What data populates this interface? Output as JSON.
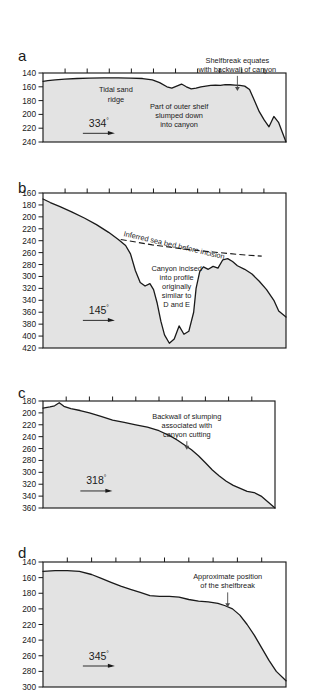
{
  "figure": {
    "type": "multi-panel-profile",
    "depth_unit": "m",
    "background_fill": "#e3e3e3",
    "line_color": "#1a1a1a"
  },
  "chart_data": [
    {
      "type": "area",
      "panel": "a",
      "label": "a",
      "ylabel": "",
      "xlabel": "",
      "ylim": [
        140,
        240
      ],
      "y_ticks": [
        140,
        160,
        180,
        200,
        220,
        240
      ],
      "y_direction": "inverted",
      "x_ticks": 11,
      "grid": false,
      "bearing": "334",
      "bearing_degree_symbol": "°",
      "annotations": [
        {
          "text_lines": [
            "Tidal sand",
            "ridge"
          ],
          "x_frac": 0.3,
          "y_depth": 168
        },
        {
          "text_lines": [
            "Part of outer shelf",
            "slumped down",
            "into canyon"
          ],
          "x_frac": 0.56,
          "y_depth": 192
        },
        {
          "text_lines": [
            "Shelfbreak equates",
            "with backwall of canyon"
          ],
          "x_frac": 0.8,
          "y_depth": 125,
          "arrow_to_depth": 166
        }
      ],
      "x": [
        0,
        2,
        5,
        9,
        14,
        19,
        25,
        31,
        36,
        41,
        45,
        48,
        51,
        53,
        55,
        57,
        59,
        61,
        63,
        65,
        67,
        69,
        71,
        73,
        75,
        77,
        79,
        81,
        83,
        85,
        87,
        89,
        91,
        93,
        95,
        97,
        100
      ],
      "y": [
        152,
        151,
        150,
        149,
        148,
        147.5,
        147,
        147,
        147.5,
        148,
        150,
        154,
        160,
        162,
        159,
        156,
        160,
        163,
        162,
        160,
        159,
        158,
        157.5,
        158,
        157,
        157,
        157.5,
        158,
        159,
        164,
        180,
        196,
        208,
        218,
        203,
        212,
        240
      ]
    },
    {
      "type": "area",
      "panel": "b",
      "label": "b",
      "ylabel": "",
      "xlabel": "",
      "ylim": [
        160,
        420
      ],
      "y_ticks": [
        160,
        180,
        200,
        220,
        240,
        260,
        280,
        300,
        320,
        340,
        360,
        380,
        400,
        420
      ],
      "y_direction": "inverted",
      "x_ticks": 11,
      "grid": false,
      "bearing": "145",
      "bearing_degree_symbol": "°",
      "annotations": [
        {
          "text_lines": [
            "Inferred sea bed before incision"
          ],
          "rotated": true,
          "x_frac": 0.33,
          "y_depth": 232
        },
        {
          "text_lines": [
            "Canyon incised",
            "into profile",
            "originally",
            "similar to",
            "D and E"
          ],
          "x_frac": 0.55,
          "y_depth": 290
        }
      ],
      "inferred_bed_dashed": {
        "x": [
          32,
          45,
          58,
          70,
          80,
          90
        ],
        "y": [
          238,
          247,
          254,
          259,
          263,
          266
        ]
      },
      "x": [
        0,
        3,
        7,
        12,
        17,
        22,
        27,
        31,
        34,
        36,
        38,
        40,
        42,
        44,
        45.5,
        47,
        48.5,
        50,
        52,
        54,
        56,
        58,
        60,
        62,
        63,
        64.5,
        66,
        68,
        70,
        72,
        74,
        76,
        78,
        80,
        83,
        86,
        89,
        92,
        95,
        97,
        100
      ],
      "y": [
        170,
        176,
        183,
        192,
        202,
        213,
        226,
        238,
        248,
        262,
        290,
        310,
        316,
        312,
        322,
        345,
        375,
        398,
        412,
        405,
        383,
        397,
        392,
        360,
        320,
        292,
        284,
        288,
        283,
        286,
        272,
        270,
        275,
        282,
        288,
        296,
        308,
        322,
        340,
        358,
        368
      ]
    },
    {
      "type": "area",
      "panel": "c",
      "label": "c",
      "ylabel": "",
      "xlabel": "",
      "ylim": [
        180,
        360
      ],
      "y_ticks": [
        180,
        200,
        220,
        240,
        260,
        280,
        300,
        320,
        340,
        360
      ],
      "y_direction": "inverted",
      "x_ticks": 10,
      "grid": false,
      "bearing": "318",
      "bearing_degree_symbol": "°",
      "annotations": [
        {
          "text_lines": [
            "Backwall of slumping",
            "associated with",
            "canyon cutting"
          ],
          "x_frac": 0.62,
          "y_depth": 210,
          "arrow_to_depth": 262
        }
      ],
      "x": [
        0,
        3,
        5,
        7,
        9,
        12,
        16,
        20,
        25,
        30,
        35,
        40,
        45,
        50,
        55,
        58,
        61,
        64,
        67,
        70,
        73,
        76,
        79,
        82,
        85,
        88,
        91,
        94,
        97,
        100
      ],
      "y": [
        192,
        190,
        188,
        183,
        189,
        193,
        196,
        200,
        206,
        212,
        216,
        220,
        224,
        230,
        239,
        246,
        254,
        262,
        272,
        284,
        296,
        306,
        315,
        322,
        327,
        332,
        334,
        340,
        350,
        360
      ]
    },
    {
      "type": "area",
      "panel": "d",
      "label": "d",
      "ylabel": "",
      "xlabel": "",
      "ylim": [
        140,
        300
      ],
      "y_ticks": [
        140,
        160,
        180,
        200,
        220,
        240,
        260,
        280,
        300
      ],
      "y_direction": "inverted",
      "x_ticks": 10,
      "grid": false,
      "bearing": "345",
      "bearing_degree_symbol": "°",
      "annotations": [
        {
          "text_lines": [
            "Approximate position",
            "of the shelfbreak"
          ],
          "x_frac": 0.76,
          "y_depth": 162,
          "arrow_to_depth": 198
        }
      ],
      "x": [
        0,
        5,
        10,
        15,
        20,
        24,
        28,
        32,
        36,
        40,
        44,
        48,
        52,
        56,
        60,
        64,
        68,
        72,
        75,
        78,
        81,
        84,
        87,
        90,
        93,
        96,
        100
      ],
      "y": [
        152,
        151,
        151,
        152,
        156,
        161,
        166,
        171,
        175,
        179,
        183,
        184,
        184,
        185,
        188,
        190,
        191,
        193,
        196,
        200,
        208,
        220,
        234,
        250,
        266,
        280,
        292
      ]
    }
  ]
}
